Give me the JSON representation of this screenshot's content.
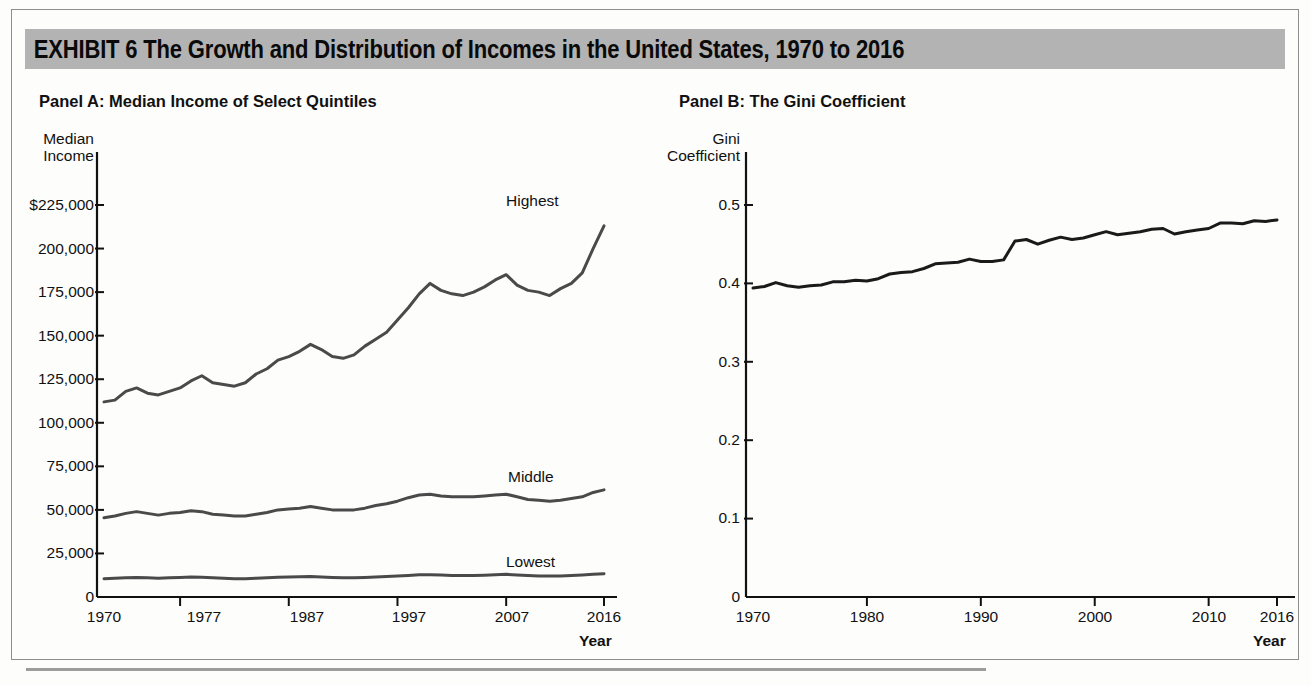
{
  "exhibit": {
    "title": "EXHIBIT 6  The Growth and Distribution of Incomes in the United States, 1970 to 2016",
    "title_bar_color": "#b3b3b3",
    "frame_color": "#8d8d8d"
  },
  "panels": {
    "a": {
      "title": "Panel A: Median Income of Select Quintiles"
    },
    "b": {
      "title": "Panel B: The Gini Coefficient"
    }
  },
  "chart_data": [
    {
      "type": "line",
      "title": "Panel A: Median Income of Select Quintiles",
      "xlabel": "Year",
      "ylabel": "Median Income",
      "ylabel_lines": [
        "Median",
        "Income"
      ],
      "xlim": [
        1970,
        2016
      ],
      "ylim": [
        0,
        225000
      ],
      "ytick_values": [
        225000,
        200000,
        175000,
        150000,
        125000,
        100000,
        75000,
        50000,
        25000,
        0
      ],
      "ytick_labels": [
        "$225,000",
        "200,000",
        "175,000",
        "150,000",
        "125,000",
        "100,000",
        "75,000",
        "50,000",
        "25,000",
        "0"
      ],
      "xtick_values": [
        1970,
        1977,
        1987,
        1997,
        2007,
        2016
      ],
      "xtick_labels": [
        "1970",
        "1977",
        "1987",
        "1997",
        "2007",
        "2016"
      ],
      "grid": false,
      "legend": "inline-end-labels",
      "line_color": "#4a4a4a",
      "x": [
        1970,
        1971,
        1972,
        1973,
        1974,
        1975,
        1976,
        1977,
        1978,
        1979,
        1980,
        1981,
        1982,
        1983,
        1984,
        1985,
        1986,
        1987,
        1988,
        1989,
        1990,
        1991,
        1992,
        1993,
        1994,
        1995,
        1996,
        1997,
        1998,
        1999,
        2000,
        2001,
        2002,
        2003,
        2004,
        2005,
        2006,
        2007,
        2008,
        2009,
        2010,
        2011,
        2012,
        2013,
        2014,
        2015,
        2016
      ],
      "series": [
        {
          "name": "Highest",
          "label": "Highest",
          "values": [
            112000,
            113000,
            118000,
            120000,
            117000,
            116000,
            118000,
            120000,
            124000,
            127000,
            123000,
            122000,
            121000,
            123000,
            128000,
            131000,
            136000,
            138000,
            141000,
            145000,
            142000,
            138000,
            137000,
            139000,
            144000,
            148000,
            152000,
            159000,
            166000,
            174000,
            180000,
            176000,
            174000,
            173000,
            175000,
            178000,
            182000,
            185000,
            179000,
            176000,
            175000,
            173000,
            177000,
            180000,
            186000,
            200000,
            213000
          ]
        },
        {
          "name": "Middle",
          "label": "Middle",
          "values": [
            45500,
            46500,
            48000,
            49000,
            48000,
            47000,
            48000,
            48500,
            49500,
            49000,
            47500,
            47000,
            46500,
            46500,
            47500,
            48500,
            50000,
            50500,
            51000,
            52000,
            51000,
            50000,
            50000,
            50000,
            51000,
            52500,
            53500,
            55000,
            57000,
            58500,
            59000,
            58000,
            57500,
            57500,
            57500,
            58000,
            58500,
            59000,
            57500,
            56000,
            55500,
            55000,
            55500,
            56500,
            57500,
            60000,
            61500
          ]
        },
        {
          "name": "Lowest",
          "label": "Lowest",
          "values": [
            10500,
            10700,
            11000,
            11200,
            11000,
            10800,
            11000,
            11200,
            11500,
            11300,
            11000,
            10800,
            10500,
            10500,
            10800,
            11000,
            11300,
            11500,
            11600,
            11800,
            11500,
            11200,
            11000,
            11000,
            11200,
            11500,
            11700,
            12000,
            12400,
            12700,
            12800,
            12600,
            12400,
            12400,
            12400,
            12500,
            12700,
            13000,
            12600,
            12300,
            12100,
            12000,
            12100,
            12300,
            12600,
            13000,
            13400
          ]
        }
      ]
    },
    {
      "type": "line",
      "title": "Panel B: The Gini Coefficient",
      "xlabel": "Year",
      "ylabel": "Gini Coefficient",
      "ylabel_lines": [
        "Gini",
        "Coefficient"
      ],
      "xlim": [
        1970,
        2016
      ],
      "ylim": [
        0,
        0.5
      ],
      "ytick_values": [
        0.5,
        0.4,
        0.3,
        0.2,
        0.1,
        0
      ],
      "ytick_labels": [
        "0.5",
        "0.4",
        "0.3",
        "0.2",
        "0.1",
        "0"
      ],
      "xtick_values": [
        1970,
        1980,
        1990,
        2000,
        2010,
        2016
      ],
      "xtick_labels": [
        "1970",
        "1980",
        "1990",
        "2000",
        "2010",
        "2016"
      ],
      "grid": false,
      "line_color": "#1a1a1a",
      "x": [
        1970,
        1971,
        1972,
        1973,
        1974,
        1975,
        1976,
        1977,
        1978,
        1979,
        1980,
        1981,
        1982,
        1983,
        1984,
        1985,
        1986,
        1987,
        1988,
        1989,
        1990,
        1991,
        1992,
        1993,
        1994,
        1995,
        1996,
        1997,
        1998,
        1999,
        2000,
        2001,
        2002,
        2003,
        2004,
        2005,
        2006,
        2007,
        2008,
        2009,
        2010,
        2011,
        2012,
        2013,
        2014,
        2015,
        2016
      ],
      "series": [
        {
          "name": "Gini Coefficient",
          "label": "Gini",
          "values": [
            0.394,
            0.396,
            0.401,
            0.397,
            0.395,
            0.397,
            0.398,
            0.402,
            0.402,
            0.404,
            0.403,
            0.406,
            0.412,
            0.414,
            0.415,
            0.419,
            0.425,
            0.426,
            0.427,
            0.431,
            0.428,
            0.428,
            0.43,
            0.454,
            0.456,
            0.45,
            0.455,
            0.459,
            0.456,
            0.458,
            0.462,
            0.466,
            0.462,
            0.464,
            0.466,
            0.469,
            0.47,
            0.463,
            0.466,
            0.468,
            0.47,
            0.477,
            0.477,
            0.476,
            0.48,
            0.479,
            0.481
          ]
        }
      ]
    }
  ]
}
